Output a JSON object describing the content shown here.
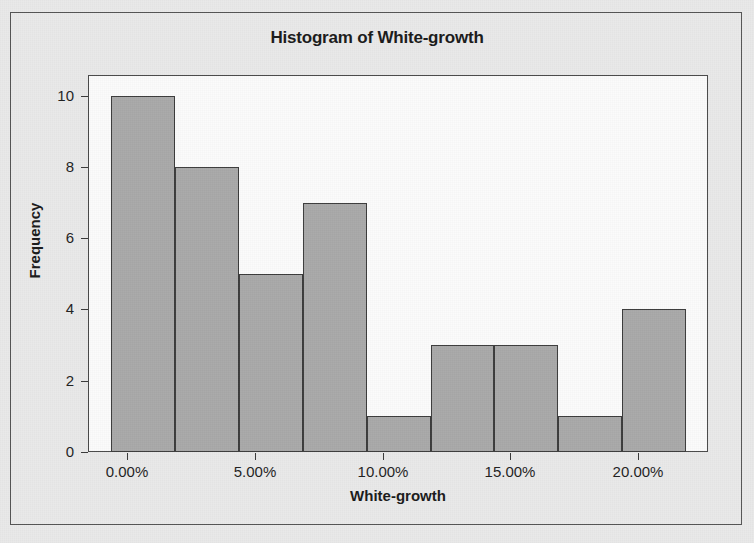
{
  "figure": {
    "title": "Histogram of White-growth",
    "background_color": "#e9e9e9",
    "plot_background_color": "#fbfbfb",
    "bar_fill_color": "#a9a9a9",
    "bar_edge_color": "#3c3c3c",
    "frame_color": "#4a4a4a"
  },
  "chart_data": {
    "type": "bar",
    "title": "Histogram of White-growth",
    "xlabel": "White-growth",
    "ylabel": "Frequency",
    "categories": [
      "-0.63% to 1.88%",
      "1.88% to 4.38%",
      "4.38% to 6.88%",
      "6.88% to 9.38%",
      "9.38% to 11.88%",
      "11.88% to 14.38%",
      "14.38% to 16.88%",
      "16.88% to 19.38%",
      "19.38% to 21.88%"
    ],
    "values": [
      10,
      8,
      5,
      7,
      1,
      3,
      3,
      1,
      4
    ],
    "bin_width_percent": 2.5,
    "bin_edges_percent": [
      -0.625,
      1.875,
      4.375,
      6.875,
      9.375,
      11.875,
      14.375,
      16.875,
      19.375,
      21.875
    ],
    "xlim": [
      -1.5,
      22.7
    ],
    "ylim": [
      0,
      10.55
    ],
    "ytick_values": [
      0,
      2,
      4,
      6,
      8,
      10
    ],
    "ytick_labels": [
      "0",
      "2",
      "4",
      "6",
      "8",
      "10"
    ],
    "xtick_values": [
      0,
      5,
      10,
      15,
      20
    ],
    "xtick_labels": [
      "0.00%",
      "5.00%",
      "10.00%",
      "15.00%",
      "20.00%"
    ],
    "grid": false,
    "legend": null,
    "total_count": 42
  }
}
